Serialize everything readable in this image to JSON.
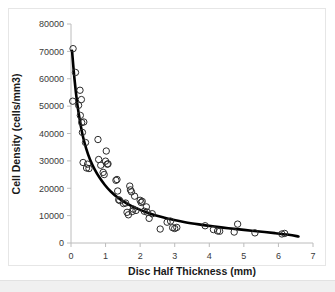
{
  "figure": {
    "background_color": "#ffffff",
    "frame_border_color": "#e6e6e6",
    "bottom_strip_color": "#f0f0f0"
  },
  "chart_data": {
    "type": "scatter",
    "title": "",
    "subtitle": "",
    "xlabel": "Disc Half Thickness (mm)",
    "ylabel": "Cell Density (cells/mm3)",
    "xlim": [
      0,
      7
    ],
    "ylim": [
      0,
      80000
    ],
    "xticks": [
      0,
      1,
      2,
      3,
      4,
      5,
      6,
      7
    ],
    "xtick_labels": [
      "0",
      "1",
      "2",
      "3",
      "4",
      "5",
      "6",
      "7"
    ],
    "yticks": [
      0,
      10000,
      20000,
      30000,
      40000,
      50000,
      60000,
      70000,
      80000
    ],
    "ytick_labels": [
      "0",
      "10000",
      "20000",
      "30000",
      "40000",
      "50000",
      "60000",
      "70000",
      "80000"
    ],
    "grid": false,
    "legend": null,
    "marker": {
      "shape": "open-circle",
      "radius": 3.2,
      "edge_color": "#2b2b2b",
      "fill_color": "none"
    },
    "series": [
      {
        "name": "Cell Density Measurements",
        "type": "scatter",
        "points": [
          [
            0.06,
            71000
          ],
          [
            0.05,
            51800
          ],
          [
            0.13,
            62300
          ],
          [
            0.22,
            50300
          ],
          [
            0.26,
            55800
          ],
          [
            0.27,
            46600
          ],
          [
            0.3,
            52400
          ],
          [
            0.31,
            44000
          ],
          [
            0.33,
            40400
          ],
          [
            0.35,
            29400
          ],
          [
            0.37,
            44200
          ],
          [
            0.42,
            36700
          ],
          [
            0.45,
            27400
          ],
          [
            0.48,
            28800
          ],
          [
            0.52,
            27200
          ],
          [
            0.78,
            37800
          ],
          [
            0.8,
            30500
          ],
          [
            0.86,
            28400
          ],
          [
            0.93,
            25800
          ],
          [
            0.96,
            25000
          ],
          [
            1.0,
            29900
          ],
          [
            1.02,
            33600
          ],
          [
            1.05,
            28800
          ],
          [
            1.07,
            28900
          ],
          [
            1.3,
            22900
          ],
          [
            1.33,
            23200
          ],
          [
            1.35,
            19000
          ],
          [
            1.38,
            15800
          ],
          [
            1.41,
            15500
          ],
          [
            1.52,
            14400
          ],
          [
            1.58,
            14600
          ],
          [
            1.62,
            11200
          ],
          [
            1.66,
            10300
          ],
          [
            1.7,
            20800
          ],
          [
            1.72,
            19400
          ],
          [
            1.75,
            18700
          ],
          [
            1.77,
            11500
          ],
          [
            1.8,
            12400
          ],
          [
            1.84,
            17100
          ],
          [
            1.88,
            11900
          ],
          [
            2.0,
            15600
          ],
          [
            2.03,
            14800
          ],
          [
            2.06,
            15200
          ],
          [
            2.12,
            11600
          ],
          [
            2.18,
            13200
          ],
          [
            2.2,
            11300
          ],
          [
            2.26,
            9000
          ],
          [
            2.35,
            10700
          ],
          [
            2.58,
            5100
          ],
          [
            2.78,
            7600
          ],
          [
            2.88,
            8000
          ],
          [
            2.94,
            5600
          ],
          [
            3.0,
            5300
          ],
          [
            3.06,
            5700
          ],
          [
            3.88,
            6300
          ],
          [
            4.12,
            4900
          ],
          [
            4.24,
            4400
          ],
          [
            4.3,
            4300
          ],
          [
            4.72,
            4000
          ],
          [
            4.82,
            6900
          ],
          [
            5.32,
            3700
          ],
          [
            6.1,
            3300
          ],
          [
            6.18,
            3500
          ]
        ]
      },
      {
        "name": "Exponential Trend Line",
        "type": "line",
        "fit": "power-decay",
        "points": [
          [
            0.03,
            70200
          ],
          [
            0.1,
            60000
          ],
          [
            0.18,
            51000
          ],
          [
            0.26,
            44500
          ],
          [
            0.34,
            39200
          ],
          [
            0.44,
            34500
          ],
          [
            0.55,
            30500
          ],
          [
            0.68,
            27000
          ],
          [
            0.82,
            24000
          ],
          [
            0.98,
            21200
          ],
          [
            1.15,
            18800
          ],
          [
            1.35,
            16600
          ],
          [
            1.55,
            14900
          ],
          [
            1.78,
            13300
          ],
          [
            2.02,
            12000
          ],
          [
            2.3,
            10700
          ],
          [
            2.6,
            9600
          ],
          [
            2.95,
            8500
          ],
          [
            3.3,
            7600
          ],
          [
            3.7,
            6800
          ],
          [
            4.1,
            6100
          ],
          [
            4.55,
            5400
          ],
          [
            5.0,
            4800
          ],
          [
            5.45,
            4200
          ],
          [
            5.9,
            3600
          ],
          [
            6.3,
            3000
          ],
          [
            6.58,
            2400
          ]
        ]
      }
    ]
  }
}
